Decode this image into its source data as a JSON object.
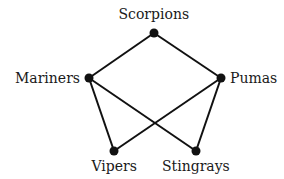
{
  "diagram": {
    "type": "graph",
    "nodes": [
      {
        "id": "scorpions",
        "label": "Scorpions",
        "x": 154,
        "y": 33,
        "label_x": 154,
        "label_y": 14,
        "anchor": "middle"
      },
      {
        "id": "mariners",
        "label": "Mariners",
        "x": 89,
        "y": 78,
        "label_x": 80,
        "label_y": 78,
        "anchor": "end"
      },
      {
        "id": "pumas",
        "label": "Pumas",
        "x": 221,
        "y": 78,
        "label_x": 230,
        "label_y": 78,
        "anchor": "start"
      },
      {
        "id": "vipers",
        "label": "Vipers",
        "x": 114,
        "y": 151,
        "label_x": 114,
        "label_y": 166,
        "anchor": "middle"
      },
      {
        "id": "stingrays",
        "label": "Stingrays",
        "x": 196,
        "y": 151,
        "label_x": 196,
        "label_y": 166,
        "anchor": "middle"
      }
    ],
    "edges": [
      [
        "scorpions",
        "mariners"
      ],
      [
        "scorpions",
        "pumas"
      ],
      [
        "mariners",
        "vipers"
      ],
      [
        "mariners",
        "stingrays"
      ],
      [
        "pumas",
        "vipers"
      ],
      [
        "pumas",
        "stingrays"
      ]
    ],
    "colors": {
      "edge": "#111111",
      "node": "#111111",
      "text": "#1a1a1a",
      "background": "#ffffff"
    }
  }
}
